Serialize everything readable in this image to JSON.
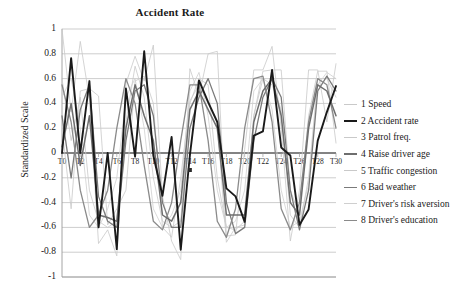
{
  "chart_data": {
    "type": "line",
    "title": "Accident Rate",
    "xlabel": "",
    "ylabel": "Standardized Scale",
    "ylim": [
      -1,
      1
    ],
    "yticks": [
      1,
      0.8,
      0.6,
      0.4,
      0.2,
      0,
      -0.2,
      -0.4,
      -0.6,
      -0.8,
      -1
    ],
    "ytick_labels": [
      "1",
      "0.8",
      "0.6",
      "0.4",
      "0.2",
      "0",
      "-0.2",
      "-0.4",
      "-0.6",
      "-0.8",
      "-1"
    ],
    "x": [
      "T0",
      "T1",
      "T2",
      "T3",
      "T4",
      "T5",
      "T6",
      "T7",
      "T8",
      "T9",
      "T10",
      "T11",
      "T12",
      "T13",
      "T14",
      "T15",
      "T16",
      "T17",
      "T18",
      "T19",
      "T20",
      "T21",
      "T22",
      "T23",
      "T24",
      "T25",
      "T26",
      "T27",
      "T28",
      "T29",
      "T30"
    ],
    "xtick_labels": [
      "T0",
      "T2",
      "T4",
      "T6",
      "T8",
      "T10",
      "T12",
      "T14",
      "T16",
      "T18",
      "T20",
      "T22",
      "T24",
      "T26",
      "T28",
      "T30"
    ],
    "grid": true,
    "zero_line": true,
    "legend_position": "right",
    "series": [
      {
        "name": "1 Speed",
        "number": "1",
        "color": "#c9c9c9",
        "width": 0.8,
        "values": [
          1.0,
          0.33,
          0.9,
          0.44,
          -0.73,
          -0.62,
          -0.83,
          0.56,
          0.78,
          0.58,
          0.87,
          -0.35,
          -0.71,
          -0.86,
          0.68,
          0.46,
          0.8,
          0.82,
          -0.67,
          -0.66,
          0.03,
          0.67,
          0.67,
          0.86,
          0.2,
          -0.71,
          -0.3,
          0.67,
          0.67,
          0.25,
          0.72
        ]
      },
      {
        "name": "2 Accident rate",
        "number": "2",
        "color": "#1a1a1a",
        "width": 1.9,
        "values": [
          0.0,
          0.765,
          0.0,
          0.58,
          -0.6,
          0.0,
          -0.775,
          0.52,
          -0.03,
          0.82,
          -0.02,
          -0.345,
          0.13,
          -0.78,
          -0.02,
          0.585,
          0.41,
          0.25,
          -0.285,
          -0.35,
          -0.555,
          0.14,
          0.175,
          0.67,
          0.045,
          -0.02,
          -0.58,
          -0.455,
          0.1,
          0.33,
          0.54
        ]
      },
      {
        "name": "3 Patrol freq.",
        "number": "3",
        "color": "#c9c9c9",
        "width": 0.8,
        "values": [
          0.2,
          -0.45,
          0.5,
          0.52,
          0.46,
          -0.58,
          -0.45,
          -0.3,
          0.58,
          0.62,
          0.4,
          -0.6,
          -0.68,
          -0.2,
          0.42,
          0.55,
          0.4,
          0.25,
          -0.72,
          -0.6,
          -0.58,
          0.3,
          0.66,
          0.67,
          0.67,
          -0.3,
          -0.5,
          0.3,
          0.66,
          0.66,
          0.08
        ]
      },
      {
        "name": "4 Raise driver age",
        "number": "4",
        "color": "#6e6e6e",
        "width": 1.5,
        "values": [
          0.05,
          0.4,
          -0.1,
          0.3,
          -0.5,
          -0.52,
          -0.55,
          0.2,
          0.55,
          0.3,
          0.1,
          -0.5,
          -0.55,
          -0.4,
          0.35,
          0.5,
          0.35,
          0.2,
          -0.5,
          -0.5,
          -0.5,
          0.25,
          0.5,
          0.6,
          0.3,
          -0.4,
          -0.5,
          0.2,
          0.55,
          0.5,
          0.3
        ]
      },
      {
        "name": "5 Traffic congestion",
        "number": "5",
        "color": "#c9c9c9",
        "width": 0.8,
        "values": [
          0.6,
          0.1,
          0.45,
          -0.3,
          -0.55,
          -0.6,
          -0.55,
          0.25,
          0.7,
          0.45,
          -0.2,
          -0.55,
          -0.6,
          -0.55,
          0.4,
          0.6,
          0.55,
          -0.2,
          -0.6,
          -0.62,
          -0.55,
          0.3,
          0.6,
          0.55,
          0.35,
          -0.5,
          -0.6,
          -0.2,
          0.6,
          0.6,
          0.45
        ]
      },
      {
        "name": "6 Bad weather",
        "number": "6",
        "color": "#7a7a7a",
        "width": 1.3,
        "values": [
          0.3,
          -0.2,
          0.35,
          0.55,
          -0.35,
          -0.55,
          -0.6,
          0.1,
          0.5,
          0.55,
          0.3,
          -0.4,
          -0.6,
          -0.6,
          0.2,
          0.45,
          0.6,
          0.4,
          -0.4,
          -0.65,
          -0.6,
          0.1,
          0.45,
          0.6,
          0.45,
          -0.3,
          -0.62,
          -0.3,
          0.5,
          0.62,
          0.5
        ]
      },
      {
        "name": "7 Driver's risk aversion",
        "number": "7",
        "color": "#cfcfcf",
        "width": 0.8,
        "values": [
          0.45,
          0.6,
          0.2,
          -0.5,
          -0.6,
          -0.45,
          -0.2,
          0.45,
          0.6,
          0.2,
          -0.45,
          -0.6,
          -0.5,
          -0.3,
          0.5,
          0.65,
          0.3,
          -0.3,
          -0.6,
          -0.55,
          -0.3,
          0.5,
          0.6,
          0.35,
          -0.3,
          -0.6,
          -0.55,
          -0.25,
          0.55,
          0.65,
          0.6
        ]
      },
      {
        "name": "8 Driver's education",
        "number": "8",
        "color": "#8a8a8a",
        "width": 1.3,
        "values": [
          0.55,
          0.25,
          -0.3,
          -0.6,
          -0.5,
          -0.3,
          0.2,
          0.6,
          0.4,
          -0.1,
          -0.55,
          -0.62,
          -0.4,
          0.1,
          0.55,
          0.55,
          0.1,
          -0.55,
          -0.68,
          -0.45,
          0.2,
          0.6,
          0.62,
          0.25,
          -0.45,
          -0.62,
          -0.4,
          0.25,
          0.6,
          0.55,
          0.2
        ]
      }
    ]
  },
  "axes": {
    "plot_left": 62,
    "plot_right": 336,
    "plot_top": 29,
    "plot_bottom": 277
  }
}
